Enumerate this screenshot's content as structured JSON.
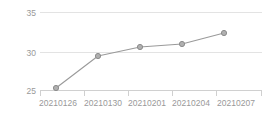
{
  "chart_data": {
    "type": "line",
    "title": "",
    "subtitle": "",
    "xlabel": "",
    "ylabel": "",
    "categories": [
      "20210126",
      "20210130",
      "20210201",
      "20210204",
      "20210207"
    ],
    "values": [
      25.6,
      29.4,
      30.6,
      31.0,
      32.4
    ],
    "series": [
      {
        "name": "",
        "values": [
          25.6,
          29.4,
          30.6,
          31.0,
          32.4
        ]
      }
    ],
    "ylim": [
      23.5,
      35.8
    ],
    "yticks": [
      25,
      30,
      35
    ],
    "ytick_labels": [
      "25",
      "30",
      "35"
    ],
    "xtick_labels": [
      "20210126",
      "20210130",
      "20210201",
      "20210204",
      "20210207"
    ],
    "grid": true,
    "grid_axis": "y",
    "legend": false,
    "legend_position": "none",
    "marker": "circle",
    "colors": {
      "line": "#9a9a9a",
      "marker_fill": "#b0b0b0",
      "marker_stroke": "#8c8c8c",
      "grid": "#e3e3e3",
      "axis": "#d0d0d0",
      "tick_label": "#999999",
      "background": "#ffffff"
    }
  },
  "axes": {
    "y_labels": [
      {
        "text": "35",
        "y": 12
      },
      {
        "text": "30",
        "y": 52
      },
      {
        "text": "25",
        "y": 90
      }
    ],
    "x_labels": [
      {
        "text": "20210126",
        "x": 56
      },
      {
        "text": "20210130",
        "x": 98
      },
      {
        "text": "20210201",
        "x": 140
      },
      {
        "text": "20210204",
        "x": 182
      },
      {
        "text": "20210207",
        "x": 224
      }
    ]
  },
  "points": [
    {
      "label": "20210126",
      "value": "25.6",
      "cx": 56,
      "cy": 88
    },
    {
      "label": "20210130",
      "value": "29.4",
      "cx": 98,
      "cy": 56
    },
    {
      "label": "20210201",
      "value": "30.6",
      "cx": 140,
      "cy": 47
    },
    {
      "label": "20210204",
      "value": "31.0",
      "cx": 182,
      "cy": 44
    },
    {
      "label": "20210207",
      "value": "32.4",
      "cx": 224,
      "cy": 33
    }
  ]
}
